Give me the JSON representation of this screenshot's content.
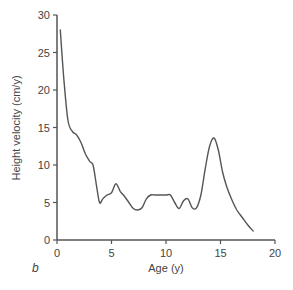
{
  "chart_data": {
    "type": "line",
    "title": "",
    "panel_label": "b",
    "xlabel": "Age (y)",
    "ylabel": "Height velocity (cm/y)",
    "xlim": [
      0,
      20
    ],
    "ylim": [
      0,
      30
    ],
    "xticks": [
      0,
      5,
      10,
      15,
      20
    ],
    "yticks": [
      0,
      5,
      10,
      15,
      20,
      25,
      30
    ],
    "grid": false,
    "legend": null,
    "series": [
      {
        "name": "Height velocity",
        "color": "#555555",
        "x": [
          0.3,
          0.6,
          1.0,
          1.4,
          1.8,
          2.2,
          2.6,
          3.0,
          3.3,
          3.6,
          3.9,
          4.2,
          4.6,
          5.0,
          5.4,
          5.8,
          6.2,
          6.6,
          7.0,
          7.4,
          7.8,
          8.2,
          8.6,
          9.0,
          9.5,
          10.0,
          10.4,
          10.8,
          11.2,
          11.6,
          12.0,
          12.4,
          12.8,
          13.2,
          13.6,
          14.0,
          14.4,
          14.8,
          15.2,
          15.6,
          16.0,
          16.5,
          17.0,
          17.5,
          18.0
        ],
        "values": [
          28.0,
          22.0,
          16.0,
          14.5,
          14.0,
          13.0,
          11.5,
          10.5,
          10.0,
          7.5,
          5.0,
          5.5,
          6.0,
          6.3,
          7.5,
          6.5,
          5.8,
          5.0,
          4.2,
          4.0,
          4.3,
          5.5,
          6.0,
          6.0,
          6.0,
          6.0,
          6.0,
          5.0,
          4.2,
          5.2,
          5.5,
          4.3,
          4.3,
          6.0,
          9.5,
          12.5,
          13.6,
          12.0,
          9.0,
          7.0,
          5.5,
          4.0,
          3.0,
          2.0,
          1.2
        ]
      }
    ]
  }
}
